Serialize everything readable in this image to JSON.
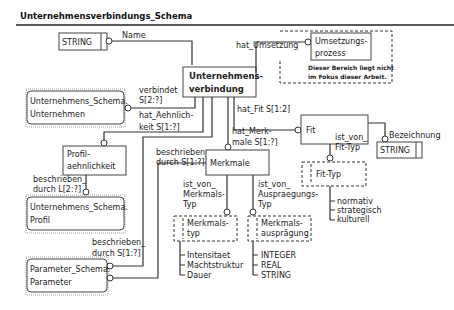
{
  "title": "Unternehmensverbindungs_Schema",
  "entities": {
    "main": {
      "line1": "Unternehmens-",
      "line2": "verbindung"
    },
    "umsetzung": {
      "line1": "Umsetzungs-",
      "line2": "prozess",
      "note1": "Dieser Bereich liegt nicht",
      "note2": "im Fokus dieser Arbeit."
    },
    "fit": {
      "label": "Fit"
    },
    "merkmale": {
      "label": "Merkmale"
    },
    "profil": {
      "line1": "Profil-",
      "line2": "aehnlichkeit"
    },
    "ext_unternehmen": {
      "line1": "Unternehmens_Schema.",
      "line2": "Unternehmen"
    },
    "ext_profil": {
      "line1": "Unternehmens_Schema.",
      "line2": "Profil"
    },
    "ext_parameter": {
      "line1": "Parameter_Schema.",
      "line2": "Parameter"
    }
  },
  "types": {
    "string_top": "STRING",
    "string_fit": "STRING",
    "fit_typ": {
      "label": "Fit-Typ",
      "values": [
        "normativ",
        "strategisch",
        "kulturell"
      ]
    },
    "merkmalstyp": {
      "line1": "Merkmals-",
      "line2": "typ",
      "values": [
        "Intensitaet",
        "Machtstruktur",
        "Dauer"
      ]
    },
    "auspraegung": {
      "line1": "Merkmals-",
      "line2": "ausprägung",
      "values": [
        "INTEGER",
        "REAL",
        "STRING"
      ]
    }
  },
  "relations": {
    "name": "Name",
    "hat_umsetzung": "hat_Umsetzung",
    "verbindet": {
      "line1": "verbindet",
      "line2": "S[2:?]"
    },
    "hat_fit": "hat_Fit S[1:2]",
    "bezeichnung": "Bezeichnung",
    "hat_aehnlichkeit": {
      "line1": "hat_Aehnlich-",
      "line2": "keit S[1:?]"
    },
    "hat_merkmale": {
      "line1": "hat_Merk-",
      "line2": "male S[1:?]"
    },
    "ist_von_fit_typ": {
      "line1": "ist_von_",
      "line2": "Fit-Typ"
    },
    "beschrieben_merkmale": {
      "line1": "beschrieben_",
      "line2": "durch S[1:?]"
    },
    "ist_von_merkmalstyp": {
      "line1": "ist_von_",
      "line2": "Merkmals-",
      "line3": "Typ"
    },
    "ist_von_auspraegungstyp": {
      "line1": "ist_von_",
      "line2": "Auspraegungs-",
      "line3": "Typ"
    },
    "beschrieben_profil": {
      "line1": "beschrieben_",
      "line2": "durch L[2:?]"
    },
    "beschrieben_param": {
      "line1": "beschrieben_",
      "line2": "durch S[1:?]"
    }
  }
}
